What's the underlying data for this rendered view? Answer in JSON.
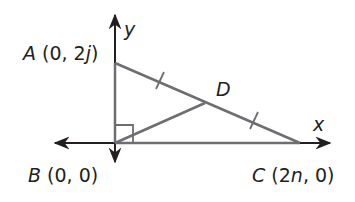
{
  "diagram": {
    "colors": {
      "axis": "#231f20",
      "triangle": "#6d6e71",
      "text": "#231f20"
    },
    "axes": {
      "x_label": "x",
      "y_label": "y"
    },
    "points": [
      {
        "name": "A",
        "coords": "(0, 2j)",
        "label": "A (0, 2j)"
      },
      {
        "name": "B",
        "coords": "(0, 0)",
        "label": "B (0, 0)"
      },
      {
        "name": "C",
        "coords": "(2n, 0)",
        "label": "C (2n, 0)"
      },
      {
        "name": "D",
        "coords": "",
        "label": "D"
      }
    ],
    "segments": [
      "AB",
      "BC",
      "AC",
      "BD"
    ],
    "marks": {
      "right_angle_at": "B",
      "congruent_ticks": [
        "AD",
        "DC"
      ]
    }
  }
}
